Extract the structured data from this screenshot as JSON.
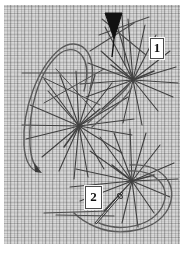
{
  "figure": {
    "title": "Embroidery stitch diagram on woven fabric",
    "ground": {
      "name": "plain-weave-fabric",
      "weave_period_px": 7,
      "colors": {
        "fabric_light": "#ffffff",
        "fabric_mid": "#e8e8e8",
        "fabric_shadow": "#b2b2b2",
        "thread_ink": "#3a3a3a",
        "needle_dark": "#111111",
        "label_text": "#111111",
        "label_fill": "#ffffff"
      }
    },
    "labels": [
      {
        "name": "step-label-1",
        "text": "1",
        "x": 150,
        "y": 38
      },
      {
        "name": "step-label-2",
        "text": "2",
        "x": 85,
        "y": 186
      }
    ],
    "elements": [
      {
        "name": "needle-arrow-top",
        "kind": "needle-tip",
        "x": 112,
        "y": 20
      },
      {
        "name": "star-cluster-top-right",
        "kind": "spider-web-stitch",
        "cx": 133,
        "cy": 80,
        "spokes": 14,
        "radius": 44
      },
      {
        "name": "star-cluster-center",
        "kind": "spider-web-stitch",
        "cx": 79,
        "cy": 126,
        "spokes": 18,
        "radius": 48
      },
      {
        "name": "star-cluster-bottom-right",
        "kind": "spider-web-stitch",
        "cx": 132,
        "cy": 181,
        "spokes": 16,
        "radius": 46
      },
      {
        "name": "thread-loop-left",
        "kind": "working-thread-curve"
      },
      {
        "name": "thread-loop-right",
        "kind": "working-thread-curve"
      },
      {
        "name": "thread-tail-arrow-lower-left",
        "kind": "thread-end-arrow",
        "x": 35,
        "y": 166
      },
      {
        "name": "needle-body-bottom",
        "kind": "needle",
        "x": 105,
        "y": 205
      },
      {
        "name": "thread-horizontal-bottom",
        "kind": "laid-thread",
        "y": 212
      }
    ]
  }
}
